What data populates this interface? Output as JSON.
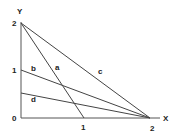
{
  "diagram": {
    "axes": {
      "x_label": "X",
      "y_label": "Y",
      "x_ticks": [
        "1",
        "2"
      ],
      "y_ticks": [
        "0",
        "1",
        "2"
      ]
    },
    "lines": [
      {
        "label": "a",
        "from": [
          0,
          2
        ],
        "to": [
          1,
          0
        ]
      },
      {
        "label": "b",
        "from": [
          0,
          1
        ],
        "to": [
          2,
          0
        ]
      },
      {
        "label": "c",
        "from": [
          0,
          2
        ],
        "to": [
          2,
          0
        ]
      },
      {
        "label": "d",
        "from": [
          0,
          0.5
        ],
        "to": [
          2,
          0
        ]
      }
    ],
    "colors": {
      "line": "#444444",
      "text": "#222222"
    }
  }
}
